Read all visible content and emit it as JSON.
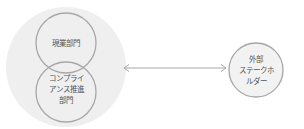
{
  "diagram": {
    "colors": {
      "background_circle": "#efefef",
      "circle_stroke": "#a8a8a8",
      "circle_fill_right": "#f2f2f2",
      "arrow": "#a8a8a8",
      "text": "#555555"
    },
    "internal_group": {
      "top_circle": {
        "label": "現業部門"
      },
      "bottom_circle": {
        "label_lines": [
          "コンプライ",
          "アンス推進",
          "部門"
        ]
      }
    },
    "arrow": {
      "type": "bidirectional"
    },
    "external_circle": {
      "label_lines": [
        "外部",
        "ステークホ",
        "ルダー"
      ]
    }
  }
}
